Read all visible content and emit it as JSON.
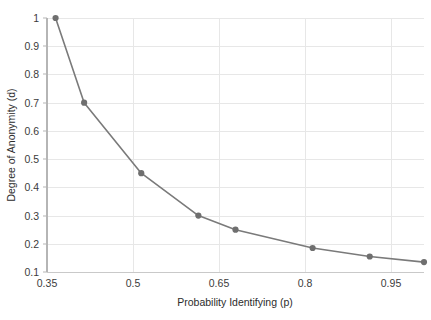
{
  "chart_data": {
    "type": "line",
    "title": "",
    "subtitle": "",
    "xlabel": "Probability Identifying (p)",
    "ylabel": "Degree of Anonymity (d)",
    "xlim": [
      0.335,
      0.995
    ],
    "ylim": [
      0.1,
      1.0
    ],
    "xticks": [
      0.35,
      0.5,
      0.65,
      0.8,
      0.95
    ],
    "xticklabels": [
      "0.35",
      "0.5",
      "0.65",
      "0.8",
      "0.95"
    ],
    "yticks": [
      0.1,
      0.2,
      0.3,
      0.4,
      0.5,
      0.6,
      0.7,
      0.8,
      0.9,
      1.0
    ],
    "yticklabels": [
      "0.1",
      "0.2",
      "0.3",
      "0.4",
      "0.5",
      "0.6",
      "0.7",
      "0.8",
      "0.9",
      "1"
    ],
    "grid": "horizontal-and-vertical",
    "legend": "none",
    "x": [
      0.35,
      0.4,
      0.5,
      0.6,
      0.665,
      0.8,
      0.9,
      0.995
    ],
    "y": [
      1.0,
      0.7,
      0.45,
      0.3,
      0.25,
      0.185,
      0.155,
      0.135
    ],
    "series": [
      {
        "name": "Degree of Anonymity",
        "x": [
          0.35,
          0.4,
          0.5,
          0.6,
          0.665,
          0.8,
          0.9,
          0.995
        ],
        "values": [
          1.0,
          0.7,
          0.45,
          0.3,
          0.25,
          0.185,
          0.155,
          0.135
        ],
        "color": "#7a7a7a",
        "marker": "circle",
        "line_width": 1.6
      }
    ],
    "colors": {
      "line": "#7a7a7a",
      "marker": "#6f6f6f",
      "grid": "#e7e7e7",
      "axis": "#b0b0b0",
      "text": "#333333",
      "background": "#ffffff"
    }
  }
}
